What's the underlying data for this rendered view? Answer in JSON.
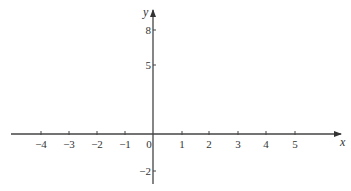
{
  "chart_data": {
    "type": "line",
    "title": "",
    "xlabel": "x",
    "ylabel": "y",
    "x_ticks": [
      -4,
      -3,
      -2,
      -1,
      0,
      1,
      2,
      3,
      4,
      5
    ],
    "x_tick_labels": [
      "−4",
      "−3",
      "−2",
      "−1",
      "0",
      "1",
      "2",
      "3",
      "4",
      "5"
    ],
    "y_ticks": [
      -2,
      5,
      8
    ],
    "y_tick_labels": [
      "−2",
      "5",
      "8"
    ],
    "series": [],
    "grid": false,
    "legend": null,
    "note": "Empty coordinate axes with arrows; no plotted data"
  },
  "colors": {
    "axis": "#444444",
    "text": "#333333",
    "background": "#ffffff"
  },
  "layout": {
    "origin_px": [
      153,
      134
    ],
    "x_axis_px": [
      11,
      341
    ],
    "y_axis_px": [
      10,
      184
    ],
    "x_tick_px": [
      41,
      69,
      97,
      125,
      153,
      182,
      209,
      238,
      266,
      295
    ],
    "y_tick_px": {
      "8": 30,
      "5": 65,
      "-2": 171
    }
  }
}
